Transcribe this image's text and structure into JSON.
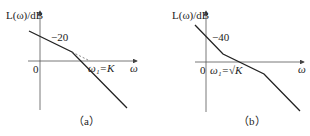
{
  "figures": [
    {
      "id": "a",
      "y_label": "L(ω)/dB",
      "slope_label": "−20",
      "origin_label": "0",
      "x_label": "ω",
      "corner_label": "ω₁=K",
      "caption": "（a）"
    },
    {
      "id": "b",
      "y_label": "L(ω)/dB",
      "slope_label": "−40",
      "origin_label": "0",
      "x_label": "ω",
      "corner_label": "ω₁=√K",
      "caption": "（b）"
    }
  ],
  "colors": {
    "line": "#222222",
    "axis": "#444444"
  }
}
